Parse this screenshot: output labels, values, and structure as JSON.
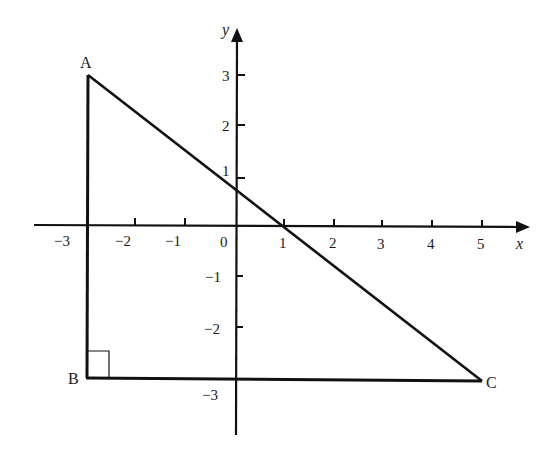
{
  "diagram": {
    "type": "coordinate-geometry",
    "axes": {
      "x": {
        "label": "x",
        "ticks": [
          "-3",
          "-2",
          "-1",
          "0",
          "1",
          "2",
          "3",
          "4",
          "5"
        ]
      },
      "y": {
        "label": "y",
        "ticks": [
          "3",
          "2",
          "1",
          "-1",
          "-2",
          "-3"
        ]
      }
    },
    "points": {
      "A": {
        "label": "A",
        "x": -3,
        "y": 3
      },
      "B": {
        "label": "B",
        "x": -3,
        "y": -3
      },
      "C": {
        "label": "C",
        "x": 5,
        "y": -3
      }
    },
    "right_angle_at": "B",
    "segments": [
      {
        "from": "A",
        "to": "B"
      },
      {
        "from": "B",
        "to": "C"
      },
      {
        "from": "A",
        "to": "C"
      }
    ],
    "origin_label": "0"
  },
  "style": {
    "stroke": "#111111",
    "background": "#ffffff"
  }
}
